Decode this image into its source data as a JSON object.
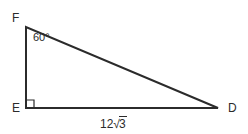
{
  "figure": {
    "type": "right-triangle",
    "background_color": "#ffffff",
    "stroke_color": "#2b2b2b",
    "stroke_width": 2,
    "vertices": [
      {
        "name": "F",
        "label": "F",
        "x": 26,
        "y": 27,
        "label_x": 12,
        "label_y": 12
      },
      {
        "name": "E",
        "label": "E",
        "x": 26,
        "y": 108,
        "label_x": 12,
        "label_y": 102
      },
      {
        "name": "D",
        "label": "D",
        "x": 218,
        "y": 108,
        "label_x": 228,
        "label_y": 102
      }
    ],
    "angles": [
      {
        "at_vertex": "F",
        "label": "60°",
        "value": 60,
        "unit": "degrees"
      },
      {
        "at_vertex": "E",
        "label": "",
        "value": 90,
        "unit": "degrees",
        "marker": "right-angle-square"
      }
    ],
    "sides": [
      {
        "from": "E",
        "to": "D",
        "label_prefix": "12",
        "label_radicand": "3",
        "label_plain": "12√3"
      },
      {
        "from": "F",
        "to": "E",
        "label_plain": ""
      },
      {
        "from": "F",
        "to": "D",
        "label_plain": ""
      }
    ],
    "right_angle_marker": {
      "vertex": "E",
      "size": 8
    }
  }
}
